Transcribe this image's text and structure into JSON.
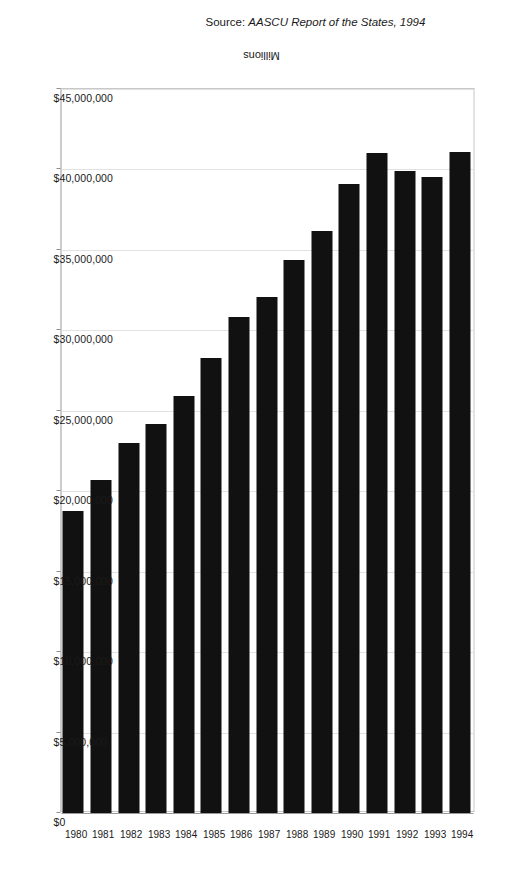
{
  "chart_data": {
    "type": "bar",
    "orientation": "horizontal",
    "title": "",
    "xlabel": "",
    "ylabel": "Millions",
    "categories": [
      "1980",
      "1981",
      "1982",
      "1983",
      "1984",
      "1985",
      "1986",
      "1987",
      "1988",
      "1989",
      "1990",
      "1991",
      "1992",
      "1993",
      "1994"
    ],
    "values": [
      18800000,
      20700000,
      23000000,
      24200000,
      25900000,
      28300000,
      30800000,
      32100000,
      34400000,
      36200000,
      39100000,
      41000000,
      39900000,
      39500000,
      41100000
    ],
    "xlim": [
      0,
      45000000
    ],
    "ylim": null,
    "grid": true,
    "legend": false,
    "legend_position": "none",
    "bar_color": "#111111",
    "tick_labels_x": [
      "$45,000,000",
      "$40,000,000",
      "$35,000,000",
      "$30,000,000",
      "$25,000,000",
      "$20,000,000",
      "$15,000,000",
      "$10,000,000",
      "$5,000,000",
      "$0"
    ],
    "tick_values_x": [
      45000000,
      40000000,
      35000000,
      30000000,
      25000000,
      20000000,
      15000000,
      10000000,
      5000000,
      0
    ],
    "annotations": [
      "Source: AASCU Report of the States, 1994"
    ]
  },
  "axis": {
    "value_axis_title": "Millions",
    "tick_labels": [
      "$45,000,000",
      "$40,000,000",
      "$35,000,000",
      "$30,000,000",
      "$25,000,000",
      "$20,000,000",
      "$15,000,000",
      "$10,000,000",
      "$5,000,000",
      "$0"
    ],
    "category_labels": [
      "1980",
      "1981",
      "1982",
      "1983",
      "1984",
      "1985",
      "1986",
      "1987",
      "1988",
      "1989",
      "1990",
      "1991",
      "1992",
      "1993",
      "1994"
    ]
  },
  "source": {
    "prefix": "Source: ",
    "text": "AASCU Report of the States, 1994",
    "full": "Source: AASCU Report of the States, 1994"
  },
  "colors": {
    "bar": "#111111",
    "grid": "#e2e2e2",
    "axis": "#9a9a9a",
    "text": "#1a1a1a",
    "background": "#ffffff"
  }
}
